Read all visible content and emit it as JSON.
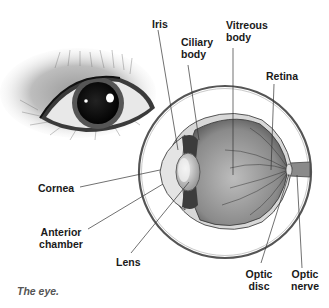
{
  "figure": {
    "caption": "The eye.",
    "colors": {
      "background": "#ffffff",
      "ink": "#1a1a1a",
      "caption": "#555555",
      "leader_line": "#333333",
      "outline_ring": "#666666"
    }
  },
  "illustrations": {
    "external_eye": "Dog eye with surrounding fur (exterior view)",
    "cross_section": "Cross-section of the eyeball inside magnifying circle"
  },
  "labels": {
    "iris": "Iris",
    "ciliary_body_1": "Ciliary",
    "ciliary_body_2": "body",
    "vitreous_body_1": "Vitreous",
    "vitreous_body_2": "body",
    "retina": "Retina",
    "cornea": "Cornea",
    "anterior_chamber_1": "Anterior",
    "anterior_chamber_2": "chamber",
    "lens": "Lens",
    "optic_disc_1": "Optic",
    "optic_disc_2": "disc",
    "optic_nerve_1": "Optic",
    "optic_nerve_2": "nerve"
  }
}
